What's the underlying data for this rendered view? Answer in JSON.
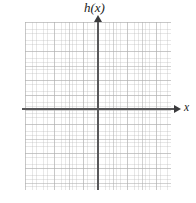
{
  "figure": {
    "type": "cartesian-coordinate-grid"
  },
  "axes": {
    "y_axis_label": "h(x)",
    "x_axis_label": "x",
    "axis_color": "#58585a",
    "arrow_color": "#3b3b3d"
  },
  "grid": {
    "line_color": "#8c8c8c",
    "background": "#ffffff",
    "major_columns": 10,
    "major_rows": 12,
    "minor_per_major": 4
  },
  "chart_data": {
    "type": "line",
    "title": "",
    "subtitle": "",
    "xlabel": "x",
    "ylabel": "h(x)",
    "series": [
      {
        "name": "h(x)",
        "x": [],
        "values": []
      }
    ],
    "xlim": [
      -5,
      5
    ],
    "ylim": [
      -6,
      6
    ],
    "xticks": [],
    "yticks": [],
    "grid": true,
    "legend": "none",
    "annotations": []
  }
}
